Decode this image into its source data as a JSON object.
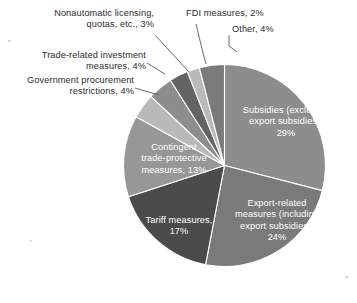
{
  "chart_data": {
    "type": "pie",
    "title": "",
    "subtitle": "",
    "xlabel": "",
    "ylabel": "",
    "legend_position": "none",
    "grid": false,
    "units": "percent",
    "start_angle_deg": 0,
    "direction": "clockwise",
    "categories": [
      "Subsidies (excluding export subsidies)",
      "Export-related measures (including export subsidies)",
      "Tariff measures",
      "Contingent trade-protective measures",
      "Government procurement restrictions",
      "Trade-related investment measures",
      "Nonautomatic licensing, quotas, etc.",
      "FDI measures",
      "Other"
    ],
    "values": [
      29,
      24,
      17,
      13,
      4,
      4,
      3,
      2,
      4
    ],
    "colors": [
      "#8d8d8d",
      "#7a7a7a",
      "#4b4b4b",
      "#979797",
      "#b9b9b9",
      "#8d8d8d",
      "#636363",
      "#b9b9b9",
      "#7a7a7a"
    ],
    "slices": [
      {
        "label": "Subsidies (excluding export subsidies)",
        "value": 29,
        "value_text": "29%",
        "color": "#8d8d8d",
        "label_placement": "inside"
      },
      {
        "label": "Export-related measures (including export subsidies)",
        "value": 24,
        "value_text": "24%",
        "color": "#7a7a7a",
        "label_placement": "inside"
      },
      {
        "label": "Tariff measures",
        "value": 17,
        "value_text": "17%",
        "color": "#4b4b4b",
        "label_placement": "inside"
      },
      {
        "label": "Contingent trade-protective measures",
        "value": 13,
        "value_text": "13%",
        "color": "#979797",
        "label_placement": "inside"
      },
      {
        "label": "Government procurement restrictions",
        "value": 4,
        "value_text": "4%",
        "color": "#b9b9b9",
        "label_placement": "callout"
      },
      {
        "label": "Trade-related investment measures",
        "value": 4,
        "value_text": "4%",
        "color": "#8d8d8d",
        "label_placement": "callout"
      },
      {
        "label": "Nonautomatic licensing, quotas, etc.",
        "value": 3,
        "value_text": "3%",
        "color": "#636363",
        "label_placement": "callout"
      },
      {
        "label": "FDI measures",
        "value": 2,
        "value_text": "2%",
        "color": "#b9b9b9",
        "label_placement": "callout"
      },
      {
        "label": "Other",
        "value": 4,
        "value_text": "4%",
        "color": "#7a7a7a",
        "label_placement": "callout"
      }
    ]
  },
  "inner_labels": {
    "subsidies": "Subsidies (excluding\nexport subsidies),\n29%",
    "export_related": "Export-related\nmeasures (including\nexport subsidies),\n24%",
    "tariff": "Tariff measures,\n17%",
    "contingent": "Contingent\ntrade-protective\nmeasures, 13%"
  },
  "callout_labels": {
    "nonautomatic": "Nonautomatic licensing,\nquotas, etc., 3%",
    "trade_related_investment": "Trade-related investment\nmeasures, 4%",
    "government_procurement": "Government procurement\nrestrictions, 4%",
    "fdi": "FDI measures, 2%",
    "other": "Other, 4%"
  },
  "style": {
    "background": "#ffffff",
    "callout_text_color": "#2b2b2b",
    "inner_text_color": "#ffffff",
    "leader_line_color": "#5a5a5a"
  }
}
